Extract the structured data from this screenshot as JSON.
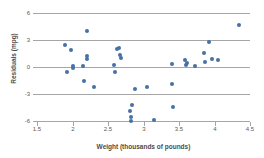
{
  "chart_data": {
    "type": "scatter",
    "title": "",
    "xlabel": "Weight (thousands of pounds)",
    "ylabel": "Residuals (mpg)",
    "xlim": [
      1.5,
      4.5
    ],
    "ylim": [
      -6,
      6
    ],
    "xticks": [
      "1.5",
      "2",
      "2.5",
      "3",
      "3.5",
      "4",
      "4.5"
    ],
    "xtick_values": [
      1.5,
      2,
      2.5,
      3,
      3.5,
      4,
      4.5
    ],
    "yticks": [
      "6",
      "3",
      "0",
      "-3",
      "-6"
    ],
    "ytick_values": [
      6,
      3,
      0,
      -3,
      -6
    ],
    "grid": "horizontal",
    "legend": "none",
    "marker_color": "#4472a4",
    "gridline_color": "#a6a6a6",
    "points": [
      {
        "x": 1.9,
        "y": 2.5
      },
      {
        "x": 1.92,
        "y": -0.6
      },
      {
        "x": 1.98,
        "y": 1.9
      },
      {
        "x": 2.0,
        "y": 0.1
      },
      {
        "x": 2.01,
        "y": -0.1
      },
      {
        "x": 2.15,
        "y": 0.1
      },
      {
        "x": 2.16,
        "y": -1.5
      },
      {
        "x": 2.2,
        "y": 4.0
      },
      {
        "x": 2.2,
        "y": 1.2
      },
      {
        "x": 2.21,
        "y": 0.9
      },
      {
        "x": 2.3,
        "y": -2.2
      },
      {
        "x": 2.58,
        "y": 0.2
      },
      {
        "x": 2.6,
        "y": -0.6
      },
      {
        "x": 2.62,
        "y": 2.0
      },
      {
        "x": 2.66,
        "y": 2.1
      },
      {
        "x": 2.67,
        "y": 1.3
      },
      {
        "x": 2.68,
        "y": 1.0
      },
      {
        "x": 2.81,
        "y": -4.9
      },
      {
        "x": 2.82,
        "y": -5.5
      },
      {
        "x": 2.83,
        "y": -6.0
      },
      {
        "x": 2.84,
        "y": -4.2
      },
      {
        "x": 2.88,
        "y": -2.4
      },
      {
        "x": 3.05,
        "y": -2.2
      },
      {
        "x": 3.15,
        "y": -5.9
      },
      {
        "x": 3.4,
        "y": 0.3
      },
      {
        "x": 3.4,
        "y": -1.9
      },
      {
        "x": 3.41,
        "y": -4.4
      },
      {
        "x": 3.58,
        "y": 0.8
      },
      {
        "x": 3.6,
        "y": 0.2
      },
      {
        "x": 3.61,
        "y": 0.4
      },
      {
        "x": 3.72,
        "y": 0.1
      },
      {
        "x": 3.85,
        "y": 1.6
      },
      {
        "x": 3.86,
        "y": 0.6
      },
      {
        "x": 3.92,
        "y": 2.8
      },
      {
        "x": 3.96,
        "y": 0.9
      },
      {
        "x": 4.05,
        "y": 0.8
      },
      {
        "x": 4.35,
        "y": 4.7
      }
    ]
  }
}
